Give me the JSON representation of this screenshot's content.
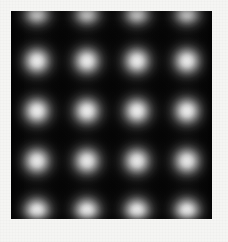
{
  "figure": {
    "kind": "grayscale-periodic-lattice-image",
    "canvas": {
      "width": 228,
      "height": 242,
      "background_color": "#f5f5f3"
    },
    "panel": {
      "x": 11,
      "y": 11,
      "width": 201,
      "height": 208,
      "background_color": "#050505",
      "border_color": "#d8d8d4"
    }
  },
  "chart_data": {
    "type": "heatmap",
    "title": "",
    "subtitle": "",
    "xlabel": "",
    "ylabel": "",
    "grid": false,
    "legend": false,
    "colormap": "grayscale",
    "value_min": 0,
    "value_max": 1,
    "color_low": "#000000",
    "color_high": "#efefef",
    "lattice": {
      "pattern": "square",
      "period_x": 50,
      "period_y": 50,
      "columns": 4,
      "rows": 5,
      "spot_fwhm": 25,
      "spot_radius": 34,
      "peak_color": "#ececec",
      "column_centers_x": [
        37,
        87,
        137,
        187
      ],
      "row_centers_y": [
        11,
        61,
        111,
        161,
        211
      ],
      "clipped_rows": [
        0,
        4
      ]
    },
    "spots": [
      {
        "cx": 37,
        "cy": 11,
        "peak": 0.94,
        "clipped": true
      },
      {
        "cx": 87,
        "cy": 11,
        "peak": 0.94,
        "clipped": true
      },
      {
        "cx": 137,
        "cy": 11,
        "peak": 0.94,
        "clipped": true
      },
      {
        "cx": 187,
        "cy": 11,
        "peak": 0.94,
        "clipped": true
      },
      {
        "cx": 37,
        "cy": 61,
        "peak": 0.92,
        "clipped": false
      },
      {
        "cx": 87,
        "cy": 61,
        "peak": 0.92,
        "clipped": false
      },
      {
        "cx": 137,
        "cy": 61,
        "peak": 0.92,
        "clipped": false
      },
      {
        "cx": 187,
        "cy": 61,
        "peak": 0.92,
        "clipped": false
      },
      {
        "cx": 37,
        "cy": 111,
        "peak": 0.93,
        "clipped": false
      },
      {
        "cx": 87,
        "cy": 111,
        "peak": 0.93,
        "clipped": false
      },
      {
        "cx": 137,
        "cy": 111,
        "peak": 0.93,
        "clipped": false
      },
      {
        "cx": 187,
        "cy": 111,
        "peak": 0.93,
        "clipped": false
      },
      {
        "cx": 37,
        "cy": 161,
        "peak": 0.91,
        "clipped": false
      },
      {
        "cx": 87,
        "cy": 161,
        "peak": 0.91,
        "clipped": false
      },
      {
        "cx": 137,
        "cy": 161,
        "peak": 0.91,
        "clipped": false
      },
      {
        "cx": 187,
        "cy": 161,
        "peak": 0.91,
        "clipped": false
      },
      {
        "cx": 37,
        "cy": 211,
        "peak": 0.94,
        "clipped": true
      },
      {
        "cx": 87,
        "cy": 211,
        "peak": 0.94,
        "clipped": true
      },
      {
        "cx": 137,
        "cy": 211,
        "peak": 0.94,
        "clipped": true
      },
      {
        "cx": 187,
        "cy": 211,
        "peak": 0.94,
        "clipped": true
      }
    ]
  }
}
